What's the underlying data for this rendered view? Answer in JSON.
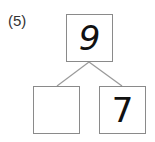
{
  "problem": {
    "label": "(5)",
    "top_value": "9",
    "left_value": "",
    "right_value": "7"
  }
}
